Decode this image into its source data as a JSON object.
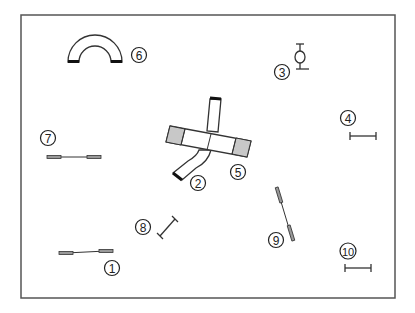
{
  "diagram": {
    "type": "dog-agility-course-map",
    "colors": {
      "background": "#ffffff",
      "frame": "#555555",
      "stroke": "#333333",
      "contact_zone": "#c8c8c8",
      "pole_fill": "#999999",
      "tunnel_end": "#111111"
    },
    "obstacles": [
      {
        "number": "1",
        "type": "jump-with-wings"
      },
      {
        "number": "2",
        "type": "tunnel-curved"
      },
      {
        "number": "3",
        "type": "tire-jump"
      },
      {
        "number": "4",
        "type": "bar-jump"
      },
      {
        "number": "5",
        "type": "dog-walk"
      },
      {
        "number": "6",
        "type": "tunnel-u-shape"
      },
      {
        "number": "7",
        "type": "jump-with-wings"
      },
      {
        "number": "8",
        "type": "bar-jump"
      },
      {
        "number": "9",
        "type": "jump-with-wings"
      },
      {
        "number": "10",
        "type": "bar-jump"
      }
    ]
  }
}
